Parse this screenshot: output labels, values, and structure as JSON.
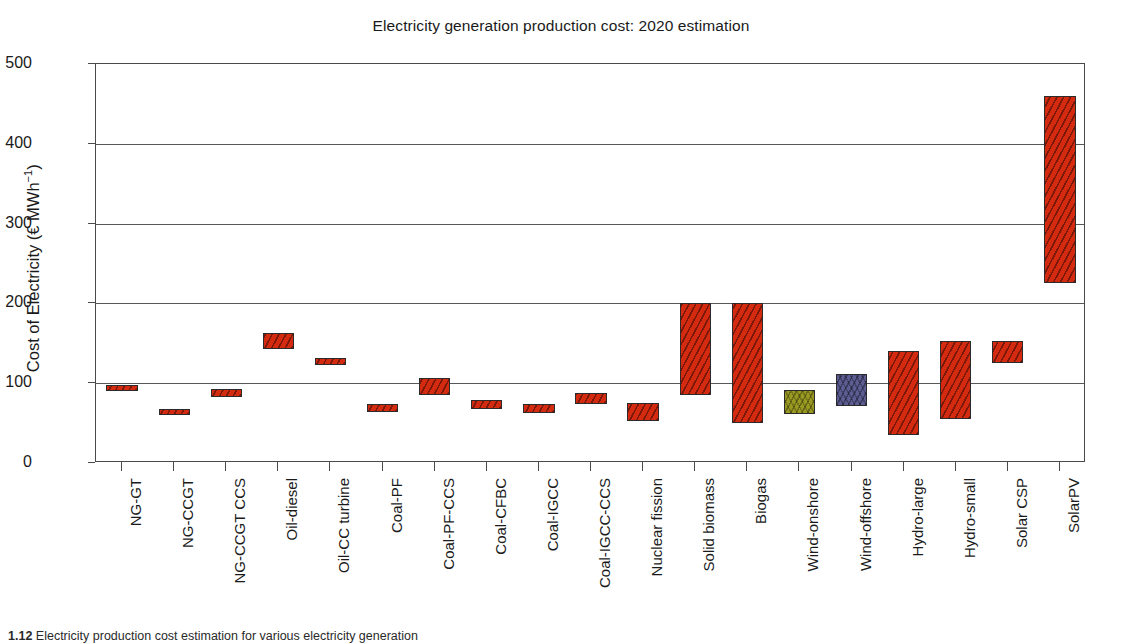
{
  "chart_data": {
    "type": "bar",
    "subtype": "floating-range-bar",
    "title": "Electricity generation production cost: 2020 estimation",
    "xlabel": "",
    "ylabel": "Cost of Electricity (€ MWh⁻¹)",
    "ylabel_plain": "Cost of Electricity (EUR MWh-1)",
    "ylim": [
      0,
      500
    ],
    "yticks": [
      0,
      100,
      200,
      300,
      400,
      500
    ],
    "grid": "horizontal",
    "legend": "none",
    "categories": [
      "NG-GT",
      "NG-CCGT",
      "NG-CCGT CCS",
      "Oil-diesel",
      "Oil-CC turbine",
      "Coal-PF",
      "Coal-PF-CCS",
      "Coal-CFBC",
      "Coal-IGCC",
      "Coal-IGCC-CCS",
      "Nuclear fission",
      "Solid biomass",
      "Biogas",
      "Wind-onshore",
      "Wind-offshore",
      "Hydro-large",
      "Hydro-small",
      "Solar CSP",
      "SolarPV"
    ],
    "series": [
      {
        "name": "Cost of electricity range",
        "low": [
          90,
          60,
          83,
          143,
          123,
          64,
          85,
          68,
          63,
          74,
          52,
          85,
          50,
          62,
          72,
          35,
          55,
          125,
          225
        ],
        "high": [
          98,
          68,
          93,
          163,
          131,
          74,
          106,
          79,
          74,
          88,
          75,
          200,
          200,
          92,
          112,
          140,
          153,
          153,
          460
        ],
        "colors": [
          "#d32a10",
          "#d32a10",
          "#d32a10",
          "#d32a10",
          "#d32a10",
          "#d32a10",
          "#d32a10",
          "#d32a10",
          "#d32a10",
          "#d32a10",
          "#d32a10",
          "#d32a10",
          "#d32a10",
          "#9a9a22",
          "#5d5d93",
          "#d32a10",
          "#d32a10",
          "#d32a10",
          "#d32a10"
        ]
      }
    ],
    "colors": {
      "fossil_and_other": "#d32a10",
      "wind_onshore": "#9a9a22",
      "wind_offshore": "#5d5d93",
      "axis": "#4a4a4a",
      "gridline": "#58585a",
      "text": "#1a1a1a",
      "background": "#ffffff"
    }
  },
  "caption": {
    "figure_number": "1.12",
    "text": "Electricity production cost estimation for various electricity generation"
  }
}
